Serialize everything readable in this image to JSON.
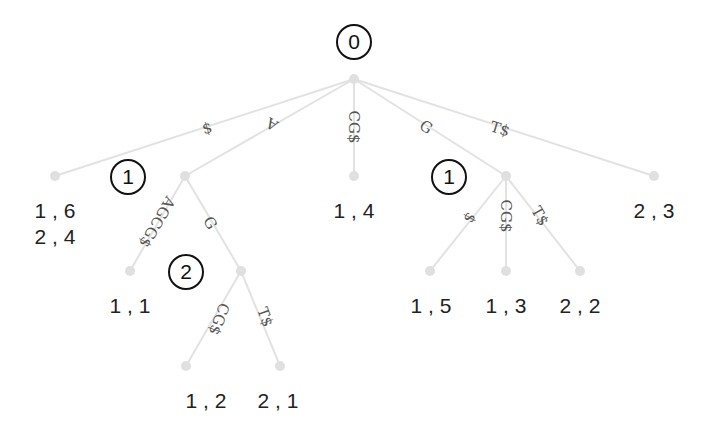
{
  "diagram": {
    "type": "suffix-tree",
    "nodes": [
      {
        "id": "root",
        "x": 354,
        "y": 79
      },
      {
        "id": "n_dollar",
        "x": 55,
        "y": 176
      },
      {
        "id": "n_A",
        "x": 185,
        "y": 176
      },
      {
        "id": "n_CG",
        "x": 354,
        "y": 176
      },
      {
        "id": "n_G",
        "x": 506,
        "y": 176
      },
      {
        "id": "n_T",
        "x": 654,
        "y": 176
      },
      {
        "id": "n_AGCG",
        "x": 130,
        "y": 271
      },
      {
        "id": "n_AG",
        "x": 241,
        "y": 271
      },
      {
        "id": "n_AGCG2",
        "x": 186,
        "y": 366
      },
      {
        "id": "n_AGT",
        "x": 280,
        "y": 366
      },
      {
        "id": "n_Gdollar",
        "x": 430,
        "y": 271
      },
      {
        "id": "n_GCG",
        "x": 506,
        "y": 271
      },
      {
        "id": "n_GT",
        "x": 580,
        "y": 271
      }
    ],
    "edges": [
      {
        "from": "root",
        "to": "n_dollar",
        "label": "$",
        "lx": 207,
        "ly": 128,
        "rot": -17
      },
      {
        "from": "root",
        "to": "n_A",
        "label": "A",
        "lx": 272,
        "ly": 124,
        "rot": -150
      },
      {
        "from": "root",
        "to": "n_CG",
        "label": "CG$",
        "lx": 354,
        "ly": 127,
        "rot": 90
      },
      {
        "from": "root",
        "to": "n_G",
        "label": "G",
        "lx": 426,
        "ly": 127,
        "rot": 33
      },
      {
        "from": "root",
        "to": "n_T",
        "label": "T$",
        "lx": 500,
        "ly": 129,
        "rot": 17
      },
      {
        "from": "n_A",
        "to": "n_AGCG",
        "label": "AGCG$",
        "lx": 157,
        "ly": 222,
        "rot": 120
      },
      {
        "from": "n_A",
        "to": "n_AG",
        "label": "G",
        "lx": 210,
        "ly": 223,
        "rot": 60
      },
      {
        "from": "n_AG",
        "to": "n_AGCG2",
        "label": "CG$",
        "lx": 219,
        "ly": 319,
        "rot": 110
      },
      {
        "from": "n_AG",
        "to": "n_AGT",
        "label": "T$",
        "lx": 265,
        "ly": 317,
        "rot": 70
      },
      {
        "from": "n_G",
        "to": "n_Gdollar",
        "label": "$",
        "lx": 470,
        "ly": 218,
        "rot": 120
      },
      {
        "from": "n_G",
        "to": "n_GCG",
        "label": "CG$",
        "lx": 506,
        "ly": 216,
        "rot": 90
      },
      {
        "from": "n_G",
        "to": "n_GT",
        "label": "T$",
        "lx": 540,
        "ly": 216,
        "rot": 60
      }
    ],
    "leaf_labels": [
      {
        "node": "n_dollar",
        "lines": [
          "1 , 6",
          "2 , 4"
        ],
        "x": 55,
        "y": 218
      },
      {
        "node": "n_CG",
        "lines": [
          "1 , 4"
        ],
        "x": 354,
        "y": 218
      },
      {
        "node": "n_T",
        "lines": [
          "2 , 3"
        ],
        "x": 654,
        "y": 218
      },
      {
        "node": "n_AGCG",
        "lines": [
          "1 , 1"
        ],
        "x": 130,
        "y": 313
      },
      {
        "node": "n_AGCG2",
        "lines": [
          "1 , 2"
        ],
        "x": 206,
        "y": 408
      },
      {
        "node": "n_AGT",
        "lines": [
          "2 , 1"
        ],
        "x": 278,
        "y": 408
      },
      {
        "node": "n_Gdollar",
        "lines": [
          "1 , 5"
        ],
        "x": 431,
        "y": 313
      },
      {
        "node": "n_GCG",
        "lines": [
          "1 , 3"
        ],
        "x": 506,
        "y": 313
      },
      {
        "node": "n_GT",
        "lines": [
          "2 , 2"
        ],
        "x": 580,
        "y": 313
      }
    ],
    "depth_markers": [
      {
        "value": "0",
        "x": 354,
        "y": 42
      },
      {
        "value": "1",
        "x": 128,
        "y": 177
      },
      {
        "value": "1",
        "x": 449,
        "y": 177
      },
      {
        "value": "2",
        "x": 186,
        "y": 272
      }
    ],
    "colors": {
      "edge": "#e2e2e2",
      "node": "#e0e0e0",
      "text": "#222222",
      "edge_label": "#555555"
    }
  }
}
